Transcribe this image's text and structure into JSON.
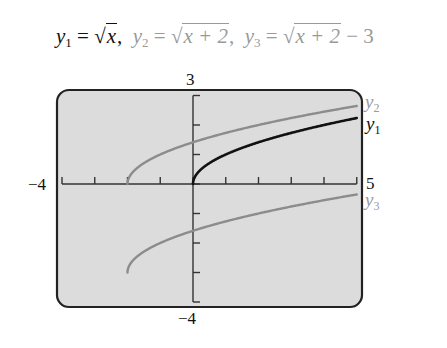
{
  "title": {
    "eq1": {
      "lhs": "y",
      "sub": "1",
      "eq": " = ",
      "radical": "√",
      "radicand": "x",
      "tail": ","
    },
    "eq2": {
      "lhs": "y",
      "sub": "2",
      "eq": " = ",
      "radical": "√",
      "radicand": "x + 2",
      "tail": ","
    },
    "eq3": {
      "lhs": "y",
      "sub": "3",
      "eq": " = ",
      "radical": "√",
      "radicand": "x + 2",
      "tail": " − 3"
    }
  },
  "axes": {
    "ymax_label": "3",
    "ymin_label": "−4",
    "xmin_label": "−4",
    "xmax_label": "5"
  },
  "curve_labels": {
    "y2": {
      "text": "y",
      "sub": "2"
    },
    "y1": {
      "text": "y",
      "sub": "1"
    },
    "y3": {
      "text": "y",
      "sub": "3"
    }
  },
  "colors": {
    "background": "#dcdcdc",
    "frame": "#222222",
    "y1": "#111111",
    "y2": "#8c8c8c",
    "y3": "#8c8c8c",
    "axis": "#333333"
  },
  "chart_data": {
    "type": "line",
    "xlabel": "",
    "ylabel": "",
    "xlim": [
      -4,
      5
    ],
    "ylim": [
      -4,
      3
    ],
    "xticks": [
      -4,
      -3,
      -2,
      -1,
      0,
      1,
      2,
      3,
      4,
      5
    ],
    "yticks": [
      -4,
      -3,
      -2,
      -1,
      0,
      1,
      2,
      3
    ],
    "grid": false,
    "legend_position": "right, inline labels at curve ends",
    "series": [
      {
        "name": "y1",
        "formula": "sqrt(x)",
        "color": "#111111",
        "x": [
          0,
          0.25,
          0.5,
          1,
          2,
          3,
          4,
          5
        ],
        "values": [
          0,
          0.5,
          0.71,
          1,
          1.41,
          1.73,
          2,
          2.24
        ]
      },
      {
        "name": "y2",
        "formula": "sqrt(x+2)",
        "color": "#8c8c8c",
        "x": [
          -2,
          -1.75,
          -1.5,
          -1,
          0,
          1,
          2,
          3,
          4,
          5
        ],
        "values": [
          0,
          0.5,
          0.71,
          1,
          1.41,
          1.73,
          2,
          2.24,
          2.45,
          2.65
        ]
      },
      {
        "name": "y3",
        "formula": "sqrt(x+2) - 3",
        "color": "#8c8c8c",
        "x": [
          -2,
          -1.75,
          -1.5,
          -1,
          0,
          1,
          2,
          3,
          4,
          5
        ],
        "values": [
          -3,
          -2.5,
          -2.29,
          -2,
          -1.59,
          -1.27,
          -1,
          -0.76,
          -0.55,
          -0.35
        ]
      }
    ]
  }
}
